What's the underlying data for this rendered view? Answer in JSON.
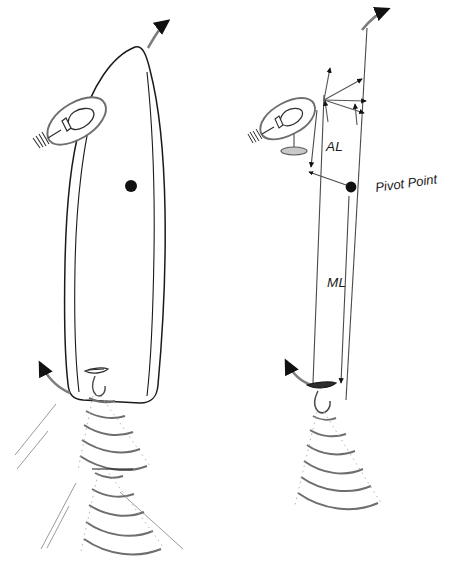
{
  "figure": {
    "background_color": "#ffffff",
    "ink_color": "#1a1a1a",
    "accent_gray": "#7d7d7d",
    "beam_gray": "#9a9a9a"
  },
  "labels": {
    "antenna_lever": "AL",
    "moment_lever": "ML",
    "pivot_point": "Pivot Point"
  },
  "panels": [
    {
      "id": "left-panel",
      "name": "vessel-plan-view",
      "description": "Survey vessel hull outline in plan view with GPS antenna, pivot point marker, transducer and multibeam swath"
    },
    {
      "id": "right-panel",
      "name": "schematic-skeleton-view",
      "description": "Schematic lever-arm skeleton showing antenna position, pivot point, AL and ML dimensions and transducer swath"
    }
  ],
  "elements": {
    "left": {
      "hull_outline": "vessel-hull",
      "gps_antenna": "gps-antenna-pod",
      "center_of_rotation": "pivot-point-dot",
      "bow_motion_arrow": "bow-yaw-arrow",
      "stern_motion_arrow": "stern-yaw-arrow",
      "transducer": "transducer-unit",
      "swath_arcs_count": 10,
      "swath_edge_lines_count": 4
    },
    "right": {
      "antenna_pod": "gps-antenna-pod",
      "antenna_mast_disc": "antenna-mast-disc",
      "pivot_point_dot": "pivot-point-dot",
      "vector_arrows_count": 6,
      "al_dimension": "al-dimension-arrow",
      "ml_dimension": "ml-dimension-arrow",
      "transducer": "transducer-unit",
      "swath_arcs_count": 9,
      "bow_motion_arrow": "bow-yaw-arrow",
      "stern_motion_arrow": "stern-yaw-arrow"
    }
  }
}
